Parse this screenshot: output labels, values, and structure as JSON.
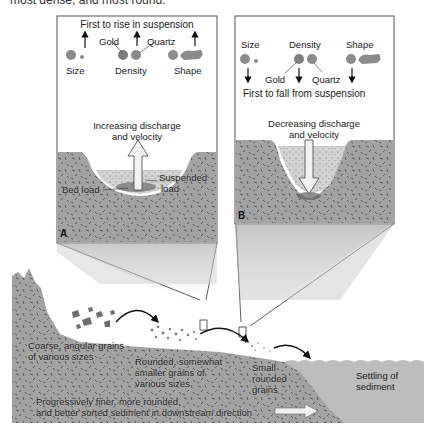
{
  "caption_clipped": "most dense, and most round.",
  "panel_a": {
    "letter": "A",
    "title": "First to rise in suspension",
    "properties": [
      "Size",
      "Density",
      "Shape"
    ],
    "minerals": [
      "Gold",
      "Quartz"
    ],
    "flow_label_line1": "Increasing discharge",
    "flow_label_line2": "and velocity",
    "bed_load": "Bed load",
    "suspended_load_line1": "Suspended",
    "suspended_load_line2": "load"
  },
  "panel_b": {
    "letter": "B",
    "title": "First to fall from suspension",
    "properties": [
      "Size",
      "Density",
      "Shape"
    ],
    "minerals": [
      "Gold",
      "Quartz"
    ],
    "flow_label_line1": "Decreasing discharge",
    "flow_label_line2": "and velocity"
  },
  "cross_section": {
    "coarse_line1": "Coarse, angular grains",
    "coarse_line2": "of various sizes",
    "rounded_line1": "Rounded, somewhat",
    "rounded_line2": "smaller grains of",
    "rounded_line3": "various sizes",
    "small_line1": "Small",
    "small_line2": "rounded",
    "small_line3": "grains",
    "settling_line1": "Settling of",
    "settling_line2": "sediment",
    "trend_line1": "Progressively finer, more rounded,",
    "trend_line2": "and better sorted sediment in downstream direction"
  },
  "colors": {
    "ground": "#9e9e9e",
    "water": "#bdbdbd",
    "panel_border": "#555555",
    "arrow": "#111111"
  }
}
